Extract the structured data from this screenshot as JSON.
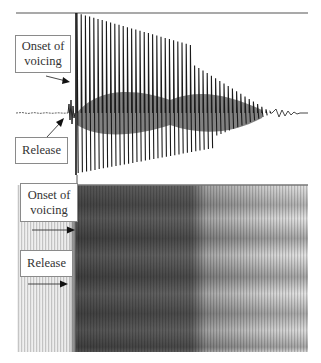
{
  "figure": {
    "waveform": {
      "labels": {
        "onset": "Onset of voicing",
        "onset_line1": "Onset of",
        "onset_line2": "voicing",
        "release": "Release"
      }
    },
    "spectrogram": {
      "labels": {
        "onset_line1": "Onset of",
        "onset_line2": "voicing",
        "release": "Release"
      }
    },
    "colors": {
      "ink": "#1a1a1a",
      "frame_line": "#8c8c8c",
      "label_border": "#8a8a8a",
      "spectrogram_dark": "#3a3a3a",
      "spectrogram_light": "#e6e6e6"
    }
  }
}
